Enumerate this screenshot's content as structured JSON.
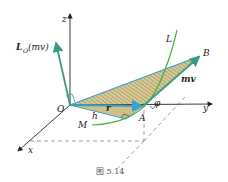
{
  "figure": {
    "caption": "图 5.14",
    "labels": {
      "z": "z",
      "x": "x",
      "y": "y",
      "origin": "O",
      "angular_momentum": "L",
      "angular_momentum_sub": "O",
      "angular_momentum_arg": "(mv)",
      "curve": "L",
      "point_b": "B",
      "point_a": "A",
      "point_m": "M",
      "momentum": "mv",
      "position": "r",
      "height": "h",
      "angle": "φ"
    },
    "colors": {
      "axis": "#222222",
      "vector": "#3aa0c8",
      "momentum_vector": "#3a9a86",
      "curve": "#4caf3c",
      "triangle_fill": "#cfc08a",
      "hatch": "#8a7a45",
      "dashed": "#888888"
    }
  }
}
